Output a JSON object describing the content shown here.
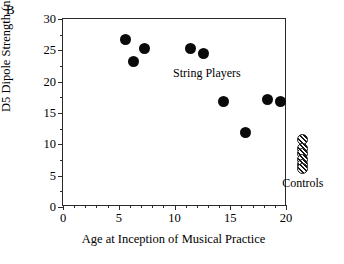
{
  "panel": {
    "label": "B"
  },
  "chart_data": {
    "type": "scatter",
    "title": "",
    "xlabel": "Age at Inception of Musical Practice",
    "ylabel": "D5 Dipole Strength (nA•m)",
    "xlim": [
      0,
      20
    ],
    "ylim": [
      0,
      30
    ],
    "xticks": [
      0,
      5,
      10,
      15,
      20
    ],
    "yticks": [
      0,
      5,
      10,
      15,
      20,
      25,
      30
    ],
    "xtick_labels": [
      "0",
      "5",
      "10",
      "15",
      "20"
    ],
    "ytick_labels": [
      "0",
      "5",
      "10",
      "15",
      "20",
      "25",
      "30"
    ],
    "x_minor_step": 1,
    "y_minor_step": 2.5,
    "grid": false,
    "legend": "none",
    "series": [
      {
        "name": "String Players",
        "marker": "filled-circle",
        "color": "#0a0a0a",
        "points": [
          {
            "x": 5.7,
            "y": 26.5
          },
          {
            "x": 6.4,
            "y": 23.0
          },
          {
            "x": 7.4,
            "y": 25.2
          },
          {
            "x": 11.5,
            "y": 25.2
          },
          {
            "x": 12.7,
            "y": 24.4
          },
          {
            "x": 14.5,
            "y": 16.6
          },
          {
            "x": 16.5,
            "y": 11.8
          },
          {
            "x": 18.4,
            "y": 17.0
          },
          {
            "x": 19.6,
            "y": 16.6
          }
        ]
      },
      {
        "name": "Controls",
        "marker": "hatched-circle",
        "color": "#141414",
        "x_position": 21.6,
        "points": [
          {
            "x": 21.6,
            "y": 10.6
          },
          {
            "x": 21.6,
            "y": 9.1
          },
          {
            "x": 21.6,
            "y": 8.3
          },
          {
            "x": 21.6,
            "y": 7.5
          },
          {
            "x": 21.6,
            "y": 6.7
          },
          {
            "x": 21.6,
            "y": 6.0
          }
        ]
      }
    ],
    "annotations": [
      {
        "text": "String Players",
        "x": 13.0,
        "y": 21.3
      },
      {
        "text": "Controls",
        "x": 21.6,
        "y": 3.6
      }
    ]
  }
}
